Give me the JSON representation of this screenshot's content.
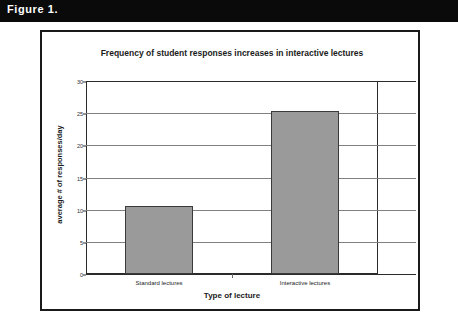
{
  "figure": {
    "caption": "Figure 1."
  },
  "chart_data": {
    "type": "bar",
    "title": "Frequency of student responses increases in interactive lectures",
    "xlabel": "Type of lecture",
    "ylabel": "average # of responses/day",
    "categories": [
      "Standard lectures",
      "Interactive lectures"
    ],
    "values": [
      10.5,
      25.4
    ],
    "ylim": [
      0,
      30
    ],
    "yticks": [
      0,
      5,
      10,
      15,
      20,
      25,
      30
    ],
    "ytick_labels": [
      "0",
      "5",
      "10",
      "15",
      "20",
      "25",
      "30"
    ],
    "grid": true,
    "legend": false,
    "bar_color": "#9a9a9a",
    "bar_border_color": "#3a3a3a",
    "gridline_color": "#808080",
    "axis_color": "#2b2b2b"
  }
}
